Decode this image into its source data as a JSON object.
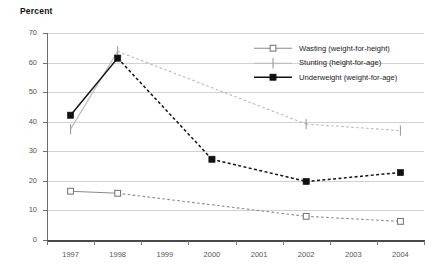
{
  "axis_title": "Percent",
  "legend": {
    "items": [
      {
        "label": "Wasting (weight-for-height)",
        "marker": "open-square-marker",
        "color": "#8a8a8a"
      },
      {
        "label": "Stunting (height-for-age)",
        "marker": "vertical-tick-marker",
        "color": "#b9b9b9"
      },
      {
        "label": "Underweight (weight-for-age)",
        "marker": "filled-square-marker",
        "color": "#111111"
      }
    ]
  },
  "chart_data": {
    "type": "line",
    "title": "",
    "xlabel": "",
    "ylabel": "Percent",
    "ylim": [
      0,
      70
    ],
    "yticks": [
      0,
      10,
      20,
      30,
      40,
      50,
      60,
      70
    ],
    "xticks": [
      "1997",
      "1998",
      "1999",
      "2000",
      "2001",
      "2002",
      "2003",
      "2004"
    ],
    "x": [
      1997,
      1998,
      2000,
      2002,
      2004
    ],
    "grid": true,
    "legend_position": "upper-right",
    "series": [
      {
        "name": "Wasting (weight-for-height)",
        "values": [
          16.5,
          15.8,
          null,
          8.0,
          6.3
        ],
        "color": "#8a8a8a",
        "marker": "open-square"
      },
      {
        "name": "Stunting (height-for-age)",
        "values": [
          37.5,
          63.8,
          null,
          39.2,
          37.0
        ],
        "color": "#b9b9b9",
        "marker": "vertical-tick"
      },
      {
        "name": "Underweight (weight-for-age)",
        "values": [
          42.2,
          61.5,
          27.3,
          19.8,
          22.8
        ],
        "color": "#111111",
        "marker": "filled-square"
      }
    ]
  }
}
